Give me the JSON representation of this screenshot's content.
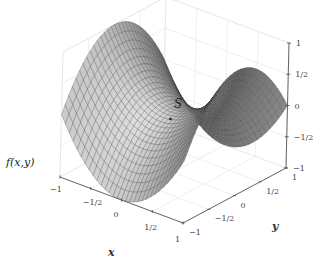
{
  "chart_data": {
    "type": "surface3d",
    "title": "",
    "function_label": "f(x,y)",
    "function": "x^2 - y^2",
    "x_axis": {
      "label": "x",
      "range": [
        -1,
        1
      ],
      "ticks": [
        "-1",
        "-1/2",
        "0",
        "1/2",
        "1"
      ]
    },
    "y_axis": {
      "label": "y",
      "range": [
        -1,
        1
      ],
      "ticks": [
        "-1",
        "-1/2",
        "0",
        "1/2",
        "1"
      ]
    },
    "z_axis": {
      "label": "f(x,y)",
      "range": [
        -1,
        1
      ],
      "ticks": [
        "-1",
        "-1/2",
        "0",
        "1/2",
        "1"
      ]
    },
    "annotations": [
      {
        "text": "S",
        "point": [
          0,
          0,
          0
        ],
        "description": "saddle point"
      }
    ],
    "grid": true,
    "mesh_resolution": 30,
    "colors": {
      "surface_light": "#d6d6d6",
      "surface_dark": "#4a4a4a",
      "mesh": "#333333",
      "grid": "#e4e4e4",
      "axis": "#555555"
    }
  }
}
